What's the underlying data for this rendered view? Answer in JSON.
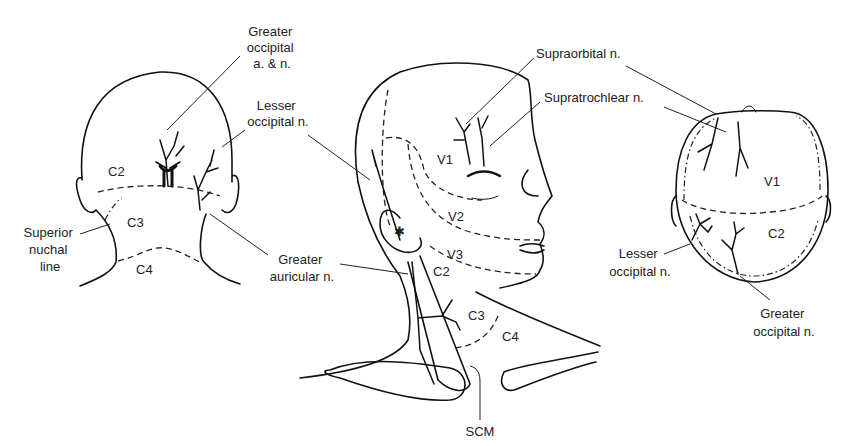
{
  "figure": {
    "views": [
      {
        "id": "posterior-view",
        "regions": [
          "C2",
          "C3",
          "C4"
        ],
        "labels": {
          "greater_occipital": [
            "Greater",
            "occipital",
            "a. & n."
          ],
          "lesser_occipital": [
            "Lesser",
            "occipital n."
          ],
          "superior_nuchal": [
            "Superior",
            "nuchal",
            "line"
          ],
          "greater_auricular": [
            "Greater",
            "auricular n."
          ]
        }
      },
      {
        "id": "lateral-view",
        "regions": [
          "V1",
          "V2",
          "V3",
          "C2",
          "C3",
          "C4"
        ],
        "labels": {
          "supraorbital": "Supraorbital n.",
          "supratrochlear": "Supratrochlear n.",
          "scm": "SCM"
        }
      },
      {
        "id": "superior-view",
        "regions": [
          "V1",
          "C2"
        ],
        "labels": {
          "lesser_occipital": [
            "Lesser",
            "occipital n."
          ],
          "greater_occipital": [
            "Greater",
            "occipital n."
          ]
        }
      }
    ]
  }
}
